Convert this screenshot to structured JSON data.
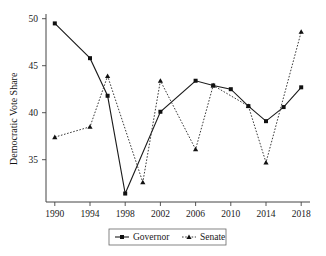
{
  "chart_data": {
    "type": "line",
    "title": "",
    "xlabel": "",
    "ylabel": "Democratic Vote Share",
    "xlim": [
      1989,
      2019
    ],
    "ylim": [
      30.5,
      50.5
    ],
    "xticks": [
      1990,
      1994,
      1998,
      2002,
      2006,
      2010,
      2014,
      2018
    ],
    "yticks": [
      35,
      40,
      45,
      50
    ],
    "grid": false,
    "legend_position": "below-axes",
    "series": [
      {
        "name": "Governor",
        "marker": "square",
        "linestyle": "solid",
        "color": "#1b1b1b",
        "x": [
          1990,
          1994,
          1996,
          1998,
          2002,
          2006,
          2008,
          2010,
          2012,
          2014,
          2016,
          2018
        ],
        "values": [
          49.5,
          45.8,
          41.8,
          31.4,
          40.1,
          43.4,
          42.9,
          42.5,
          40.7,
          39.1,
          40.6,
          42.7
        ]
      },
      {
        "name": "Senate",
        "marker": "triangle",
        "linestyle": "dashed",
        "color": "#3a3a3a",
        "x": [
          1990,
          1994,
          1996,
          2000,
          2002,
          2006,
          2008,
          2012,
          2014,
          2018
        ],
        "values": [
          37.4,
          38.5,
          43.9,
          32.6,
          43.4,
          36.1,
          42.9,
          40.7,
          34.7,
          48.6
        ]
      }
    ]
  },
  "axis": {
    "ylabel": "Democratic Vote Share",
    "xtick_labels": [
      "1990",
      "1994",
      "1998",
      "2002",
      "2006",
      "2010",
      "2014",
      "2018"
    ],
    "ytick_labels": [
      "35",
      "40",
      "45",
      "50"
    ]
  },
  "legend": {
    "entries": [
      {
        "label": "Governor",
        "marker": "square",
        "linestyle": "solid"
      },
      {
        "label": "Senate",
        "marker": "triangle",
        "linestyle": "dashed"
      }
    ]
  }
}
